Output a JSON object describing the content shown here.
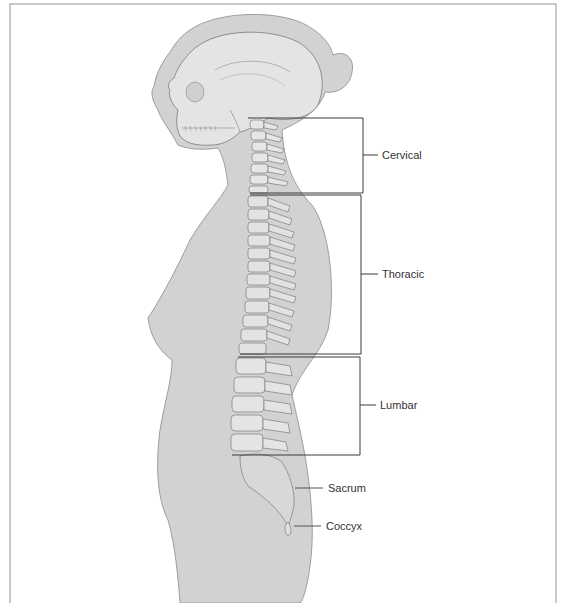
{
  "diagram": {
    "regions": [
      {
        "label": "Cervical",
        "bracket": {
          "x1": 248,
          "x2": 363,
          "top": 118,
          "bottom": 193
        },
        "label_x": 382,
        "label_y": 150
      },
      {
        "label": "Thoracic",
        "bracket": {
          "x1": 240,
          "x2": 361,
          "top": 195,
          "bottom": 354
        },
        "label_x": 382,
        "label_y": 269
      },
      {
        "label": "Lumbar",
        "bracket": {
          "x1": 232,
          "x2": 360,
          "top": 357,
          "bottom": 455
        },
        "label_x": 380,
        "label_y": 400
      }
    ],
    "pointers": [
      {
        "label": "Sacrum",
        "x1": 295,
        "y1": 488,
        "x2": 323,
        "y2": 488,
        "label_x": 328,
        "label_y": 483
      },
      {
        "label": "Coccyx",
        "x1": 294,
        "y1": 526,
        "x2": 319,
        "y2": 526,
        "label_x": 326,
        "label_y": 521
      }
    ],
    "colors": {
      "body_fill": "#d2d2d2",
      "body_stroke": "#8a8a8a",
      "bone_fill": "#e6e6e6",
      "bone_stroke": "#6d6d6d",
      "bracket_stroke": "#3a3a3a",
      "frame_stroke": "#b8b8b8"
    }
  }
}
